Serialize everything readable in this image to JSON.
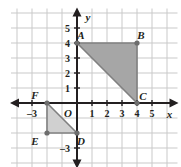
{
  "figure": {
    "type": "coordinate-plane-with-triangles",
    "grid": {
      "origin_px": [
        77,
        103
      ],
      "cell_px": 15,
      "x_min": -4.4,
      "x_max": 6.7,
      "y_min": -4.3,
      "y_max": 6.3,
      "grid_color": "#c9c9c9",
      "axis_color": "#231f20"
    },
    "axis_labels": {
      "x_name": "x",
      "y_name": "y",
      "origin": "O",
      "x_ticks": [
        {
          "value": -3,
          "label": "–3"
        },
        {
          "value": 1,
          "label": "1"
        },
        {
          "value": 2,
          "label": "2"
        },
        {
          "value": 3,
          "label": "3"
        },
        {
          "value": 4,
          "label": "4"
        },
        {
          "value": 5,
          "label": "5"
        }
      ],
      "y_ticks": [
        {
          "value": 5,
          "label": "5"
        },
        {
          "value": 4,
          "label": "4"
        },
        {
          "value": 3,
          "label": "3"
        },
        {
          "value": 2,
          "label": "2"
        },
        {
          "value": 1,
          "label": "1"
        },
        {
          "value": -3,
          "label": "–3"
        }
      ]
    },
    "shapes": [
      {
        "name": "triangle-abc",
        "fill": "#a6a6a6",
        "stroke": "#808080",
        "vertices": [
          {
            "label": "A",
            "x": 0,
            "y": 4,
            "label_dx": 4,
            "label_dy": -4
          },
          {
            "label": "B",
            "x": 4,
            "y": 4,
            "label_dx": 4,
            "label_dy": -4
          },
          {
            "label": "C",
            "x": 4,
            "y": 0,
            "label_dx": 6,
            "label_dy": -3
          }
        ]
      },
      {
        "name": "triangle-def",
        "fill": "#d0d0d0",
        "stroke": "#808080",
        "vertices": [
          {
            "label": "F",
            "x": -2,
            "y": 0,
            "label_dx": -12,
            "label_dy": -4
          },
          {
            "label": "E",
            "x": -2,
            "y": -2,
            "label_dx": -12,
            "label_dy": 12
          },
          {
            "label": "D",
            "x": 0,
            "y": -2,
            "label_dx": 4,
            "label_dy": 12
          }
        ]
      }
    ]
  }
}
